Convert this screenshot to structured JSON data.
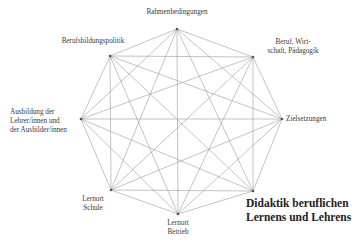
{
  "diagram": {
    "title_line1": "Didaktik beruflichen",
    "title_line2": "Lernens und Lehrens",
    "line_color": "#9a9a9a",
    "node_color": "#555555",
    "nodes": [
      {
        "id": "rahmenbedingungen",
        "x": 177,
        "y": 29,
        "label_lines": [
          "Rahmenbedingungen"
        ]
      },
      {
        "id": "beruf-wirtschaft-paedagogik",
        "x": 253,
        "y": 57,
        "label_lines": [
          "Beruf, Wirt-",
          "schaft, Pädagogik"
        ]
      },
      {
        "id": "zielsetzungen",
        "x": 282,
        "y": 119,
        "label_lines": [
          "Zielsetzungen"
        ]
      },
      {
        "id": "didaktik",
        "x": 253,
        "y": 191,
        "label_lines": []
      },
      {
        "id": "lernort-betrieb",
        "x": 178,
        "y": 214,
        "label_lines": [
          "Lernort",
          "Betrieb"
        ]
      },
      {
        "id": "lernort-schule",
        "x": 111,
        "y": 190,
        "label_lines": [
          "Lernort",
          "Schule"
        ]
      },
      {
        "id": "ausbildung",
        "x": 81,
        "y": 119,
        "label_lines": [
          "Ausbildung der",
          "Lehrer/innen und",
          "der Ausbilder/innen"
        ]
      },
      {
        "id": "berufsbildungspolitik",
        "x": 110,
        "y": 56,
        "label_lines": [
          "Berufsbildungspolitik"
        ]
      }
    ],
    "connections": "complete-graph"
  }
}
